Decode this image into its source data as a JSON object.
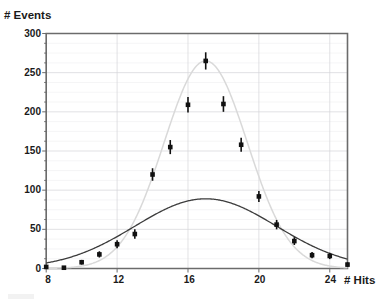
{
  "chart_data": {
    "type": "scatter",
    "title": "",
    "subtitle": "",
    "xlabel": "# Hits",
    "ylabel": "# Events",
    "xlim": [
      8,
      25
    ],
    "ylim": [
      0,
      300
    ],
    "grid": true,
    "legend_position": "none",
    "x_ticks": [
      8,
      12,
      16,
      20,
      24
    ],
    "x_tick_labels": [
      "8",
      "12",
      "16",
      "20",
      "24"
    ],
    "y_ticks": [
      0,
      50,
      100,
      150,
      200,
      250,
      300
    ],
    "y_tick_labels": [
      "0",
      "50",
      "100",
      "150",
      "200",
      "250",
      "300"
    ],
    "y_minor_step": 12.5,
    "x": [
      8,
      9,
      10,
      11,
      12,
      13,
      14,
      15,
      16,
      17,
      18,
      19,
      20,
      21,
      22,
      23,
      24,
      25
    ],
    "series": [
      {
        "name": "data",
        "style": "points-with-error-bars",
        "marker": "square",
        "color": "#111111",
        "values": [
          2,
          1,
          8,
          18,
          31,
          44,
          120,
          155,
          209,
          265,
          210,
          158,
          92,
          56,
          35,
          17,
          16,
          5
        ],
        "yerr": [
          2,
          2,
          3,
          4,
          5,
          6,
          8,
          9,
          10,
          11,
          10,
          9,
          7,
          6,
          5,
          4,
          4,
          3
        ]
      },
      {
        "name": "gaussian-fit-tall",
        "style": "line",
        "color": "#d9d9d9",
        "peak": 265,
        "mean": 17,
        "sigma": 2.35
      },
      {
        "name": "gaussian-fit-broad",
        "style": "line",
        "color": "#3c3c3c",
        "peak": 89,
        "mean": 17,
        "sigma": 4.0
      }
    ],
    "annotations": []
  },
  "axes": {
    "y_title": "# Events",
    "x_title": "# Hits"
  }
}
